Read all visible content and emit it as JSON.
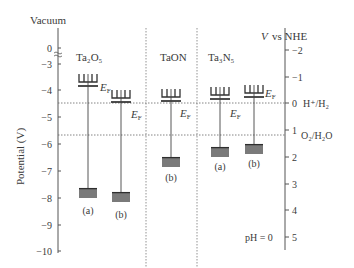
{
  "title_left": "Vacuum",
  "title_right_italic": "V",
  "title_right": "vs NHE",
  "ylabel_left": "Potential (V)",
  "left_axis_ticks": [
    {
      "label": "0",
      "y": 48
    },
    {
      "label": "−3",
      "y": 64
    },
    {
      "label": "−4",
      "y": 90
    },
    {
      "label": "−5",
      "y": 117
    },
    {
      "label": "−6",
      "y": 144
    },
    {
      "label": "−7",
      "y": 171
    },
    {
      "label": "−8",
      "y": 198
    },
    {
      "label": "−9",
      "y": 225
    },
    {
      "label": "−10",
      "y": 251
    }
  ],
  "right_axis_ticks": [
    {
      "label": "−2",
      "y": 50
    },
    {
      "label": "−1",
      "y": 77
    },
    {
      "label": "0",
      "y": 103
    },
    {
      "label": "1",
      "y": 130
    },
    {
      "label": "2",
      "y": 157
    },
    {
      "label": "3",
      "y": 184
    },
    {
      "label": "4",
      "y": 210
    },
    {
      "label": "5",
      "y": 237
    }
  ],
  "redox_levels": [
    {
      "label": "H⁺/H₂",
      "y": 103
    },
    {
      "label": "O₂/H₂O",
      "y": 135
    }
  ],
  "materials": [
    {
      "name": "Ta₂O₅",
      "label_x": 76
    },
    {
      "name": "TaON",
      "label_x": 160
    },
    {
      "name": "Ta₃N₅",
      "label_x": 208
    }
  ],
  "fermi_label": "E",
  "fermi_sub": "F",
  "samples": [
    {
      "material": "Ta2O5",
      "tag": "(a)",
      "x": 88,
      "ef_y": 86,
      "ef_label_x": 100,
      "ef_label_y": 91,
      "vb_top": 188,
      "vb_label_y": 214
    },
    {
      "material": "Ta2O5",
      "tag": "(b)",
      "x": 121,
      "ef_y": 102,
      "ef_label_x": 131,
      "ef_label_y": 118,
      "vb_top": 192,
      "vb_label_y": 218
    },
    {
      "material": "TaON",
      "tag": "(b)",
      "x": 171,
      "ef_y": 101,
      "ef_label_x": 180,
      "ef_label_y": 117,
      "vb_top": 157,
      "vb_label_y": 181
    },
    {
      "material": "Ta3N5",
      "tag": "(a)",
      "x": 220,
      "ef_y": 99,
      "ef_label_x": 230,
      "ef_label_y": 117,
      "vb_top": 147,
      "vb_label_y": 170
    },
    {
      "material": "Ta3N5",
      "tag": "(b)",
      "x": 254,
      "ef_y": 97,
      "ef_label_x": 265,
      "ef_label_y": 97,
      "vb_top": 144,
      "vb_label_y": 167
    }
  ],
  "ph_label": "pH = 0",
  "colors": {
    "axis": "#555555",
    "band": "#7a7a7a",
    "band_top": "#2e2e2e",
    "text": "#3a3a3a"
  }
}
